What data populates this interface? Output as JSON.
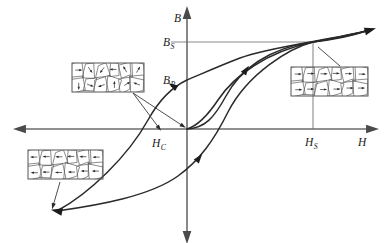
{
  "figure": {
    "background_color": "#ffffff",
    "curve_color": "#2a2a2a",
    "axis_color": "#6b6b6b",
    "guide_color": "#8a8a8a"
  },
  "axes": {
    "vertical": {
      "label": "B",
      "name": "magnetic-flux-density",
      "label_x": 174,
      "label_y": 22,
      "x": 187,
      "top_y": 13,
      "bottom_y": 237
    },
    "horizontal": {
      "label": "H",
      "name": "magnetic-field-strength",
      "label_x": 358,
      "label_y": 146,
      "y": 129,
      "left_x": 20,
      "right_x": 372
    }
  },
  "markers": [
    {
      "id": "bs",
      "base": "B",
      "sub": "S",
      "meaning": "saturation flux density",
      "label_x": 163,
      "label_y": 46,
      "value_y": 42,
      "guide_from_x": 171,
      "guide_to_x": 313
    },
    {
      "id": "br",
      "base": "B",
      "sub": "R",
      "meaning": "remanent flux density",
      "label_x": 163,
      "label_y": 84,
      "value_y": 80,
      "guide_from_x": 0,
      "guide_to_x": 0
    },
    {
      "id": "hs",
      "base": "H",
      "sub": "S",
      "meaning": "saturation field strength",
      "label_x": 305,
      "label_y": 146,
      "value_x": 313,
      "guide_from_y": 42,
      "guide_to_y": 129
    },
    {
      "id": "hc",
      "base": "H",
      "sub": "C",
      "meaning": "coercive field strength",
      "label_x": 152,
      "label_y": 147,
      "value_x": 160,
      "guide_from_y": 0,
      "guide_to_y": 0
    }
  ],
  "chart_data": {
    "type": "line",
    "xlabel": "H",
    "ylabel": "B",
    "grid": false,
    "legend": "none",
    "annotations": [
      "B_S",
      "B_R",
      "H_S",
      "H_C"
    ],
    "series": [
      {
        "name": "initial-magnetization-curve",
        "description": "virgin curve rising from the origin to positive saturation",
        "path": "M 187 129 C 205 128 214 118 226 96 C 240 70 268 48 313 42 C 338 39 352 36 366 31",
        "arrow": null
      },
      {
        "name": "upper-descending-branch",
        "description": "from positive saturation through B_R and H_C down to negative saturation",
        "path": "M 366 31 C 330 40 268 47 240 58 C 214 68 197 76 187 80 C 170 88 158 102 148 120 C 128 156 90 193 57 211",
        "arrow": {
          "x": 173,
          "y": 86,
          "angle": 212
        }
      },
      {
        "name": "lower-ascending-branch",
        "description": "from negative saturation back up through -B_R and H_C to positive saturation",
        "path": "M 57 211 C 100 205 150 196 178 176 C 200 160 214 140 228 112 C 248 73 290 48 313 42 C 338 37 352 35 366 31",
        "arrow": {
          "x": 199,
          "y": 158,
          "angle": 308
        }
      },
      {
        "name": "inner-return-branch",
        "description": "steeper inner branch rising from near the origin to saturation",
        "path": "M 187 129 C 197 126 206 118 218 100 C 234 76 266 52 313 42 C 338 38 352 35 366 31",
        "arrow": {
          "x": 246,
          "y": 70,
          "angle": 305
        }
      }
    ],
    "axis_arrow_tips": {
      "h_right": [
        372,
        129
      ],
      "h_left": [
        20,
        129
      ],
      "b_top": [
        187,
        13
      ],
      "b_bottom": [
        187,
        237
      ]
    },
    "saturation_point": [
      313,
      42
    ],
    "curve_end_negative": [
      57,
      211
    ],
    "curve_end_positive": [
      366,
      31
    ]
  },
  "insets": [
    {
      "id": "inset-random-domains",
      "name": "microstructure-inset-demagnetized",
      "caption": "",
      "description": "grain microstructure with randomly oriented magnetic domain arrows (demagnetized state)",
      "x": 72,
      "y": 63,
      "width": 72,
      "height": 29,
      "orientation": "random"
    },
    {
      "id": "inset-negative-saturation",
      "name": "microstructure-inset-negative-saturation",
      "caption": "",
      "description": "grain microstructure with all domain arrows aligned to the left (negative saturation)",
      "x": 28,
      "y": 150,
      "width": 75,
      "height": 29,
      "orientation": "left"
    },
    {
      "id": "inset-positive-saturation",
      "name": "microstructure-inset-positive-saturation",
      "caption": "",
      "description": "grain microstructure with all domain arrows aligned to the right (positive saturation)",
      "x": 291,
      "y": 67,
      "width": 77,
      "height": 29,
      "orientation": "right"
    }
  ],
  "leaders": [
    {
      "name": "leader-to-coercivity-point",
      "from": [
        133,
        93
      ],
      "to": [
        159,
        128
      ],
      "has_arrow": true
    },
    {
      "name": "leader-to-origin-point",
      "from": [
        133,
        93
      ],
      "to": [
        183,
        126
      ],
      "has_arrow": true
    },
    {
      "name": "leader-from-saturation-to-right-inset",
      "from": [
        318,
        47
      ],
      "to": [
        340,
        66
      ],
      "has_arrow": false
    },
    {
      "name": "leader-from-left-inset-to-negative-end",
      "from": [
        60,
        182
      ],
      "to": [
        53,
        206
      ],
      "has_arrow": true
    }
  ]
}
